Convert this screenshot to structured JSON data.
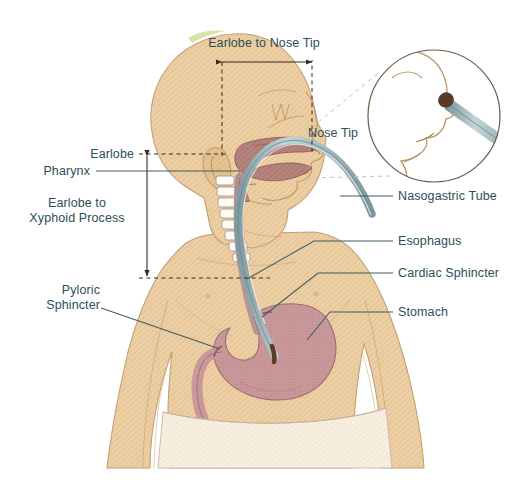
{
  "figure": {
    "background_color": "#ffffff",
    "label_text_color": "#2c4f56",
    "leader_line_color": "#3d5e66",
    "dimension_line_color": "#3a2a1e"
  },
  "palette": {
    "skin": "#edcfa4",
    "skin_shadow": "#e3bf90",
    "skin_outline": "#c2a074",
    "stomach": "#c8989a",
    "stomach_outline": "#9c6d70",
    "pharynx": "#b5827c",
    "pharynx_outline": "#8e5f5a",
    "tube_body": "#a6bcc0",
    "tube_outline": "#6e8c92",
    "vertebra": "#fdfcf8",
    "vertebra_outline": "#a99a84",
    "diaper": "#f6ecdd",
    "diaper_outline": "#cbbda6",
    "nostril": "#5a3a24",
    "hair_tint": "#c7d98a",
    "inset_circle_outline": "#6b5a44"
  },
  "labels": {
    "earlobe_to_nose_tip": "Earlobe to Nose Tip",
    "nose_tip": "Nose Tip",
    "earlobe": "Earlobe",
    "pharynx": "Pharynx",
    "earlobe_to_xyphoid_process": "Earlobe to\nXyphoid Process",
    "pyloric_sphincter": "Pyloric\nSphincter",
    "nasogastric_tube": "Nasogastric Tube",
    "esophagus": "Esophagus",
    "cardiac_sphincter": "Cardiac Sphincter",
    "stomach": "Stomach"
  },
  "measurements": [
    {
      "name": "earlobe-to-nose-tip",
      "label": "Earlobe to Nose Tip",
      "orientation": "horizontal",
      "from": "Earlobe",
      "to": "Nose Tip"
    },
    {
      "name": "earlobe-to-xyphoid-process",
      "label": "Earlobe to Xyphoid Process",
      "orientation": "vertical",
      "from": "Earlobe",
      "to": "Xyphoid Process"
    }
  ],
  "anatomy_parts": [
    "Nasogastric Tube",
    "Pharynx",
    "Esophagus",
    "Cardiac Sphincter",
    "Stomach",
    "Pyloric Sphincter"
  ]
}
